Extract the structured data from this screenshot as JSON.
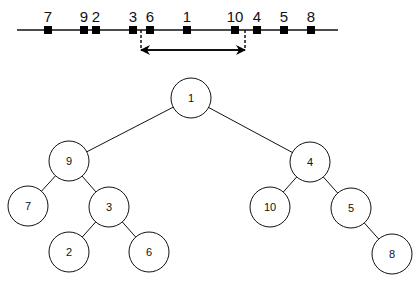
{
  "number_line": {
    "x_start": 17,
    "x_end": 338,
    "y": 30,
    "points": [
      {
        "label": "7",
        "x": 48
      },
      {
        "label": "9",
        "x": 84
      },
      {
        "label": "2",
        "x": 96
      },
      {
        "label": "3",
        "x": 133
      },
      {
        "label": "6",
        "x": 150
      },
      {
        "label": "1",
        "x": 187
      },
      {
        "label": "10",
        "x": 235
      },
      {
        "label": "4",
        "x": 257
      },
      {
        "label": "5",
        "x": 284
      },
      {
        "label": "8",
        "x": 311
      }
    ],
    "range_marker": {
      "left_x": 141,
      "right_x": 245,
      "arrow_y": 50,
      "type": "double-arrow"
    }
  },
  "tree": {
    "radius": 20,
    "nodes": [
      {
        "id": "1",
        "label": "1",
        "x": 191,
        "y": 98
      },
      {
        "id": "9",
        "label": "9",
        "x": 69,
        "y": 161
      },
      {
        "id": "4",
        "label": "4",
        "x": 310,
        "y": 162
      },
      {
        "id": "7",
        "label": "7",
        "x": 28,
        "y": 206
      },
      {
        "id": "3",
        "label": "3",
        "x": 109,
        "y": 207
      },
      {
        "id": "10",
        "label": "10",
        "x": 270,
        "y": 207
      },
      {
        "id": "5",
        "label": "5",
        "x": 351,
        "y": 208
      },
      {
        "id": "2",
        "label": "2",
        "x": 69,
        "y": 252
      },
      {
        "id": "6",
        "label": "6",
        "x": 149,
        "y": 252
      },
      {
        "id": "8",
        "label": "8",
        "x": 392,
        "y": 254
      }
    ],
    "edges": [
      [
        "1",
        "9"
      ],
      [
        "1",
        "4"
      ],
      [
        "9",
        "7"
      ],
      [
        "9",
        "3"
      ],
      [
        "3",
        "2"
      ],
      [
        "3",
        "6"
      ],
      [
        "4",
        "10"
      ],
      [
        "4",
        "5"
      ],
      [
        "5",
        "8"
      ]
    ]
  },
  "colors": {
    "stroke": "#111111",
    "fill": "#ffffff",
    "marker": "#000000"
  }
}
